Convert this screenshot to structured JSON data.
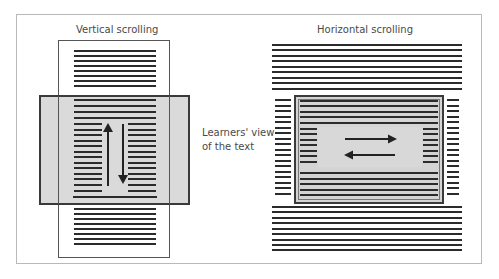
{
  "diagram": {
    "left_panel": {
      "title": "Vertical scrolling",
      "arrows": [
        "up",
        "down"
      ]
    },
    "right_panel": {
      "title": "Horizontal scrolling",
      "arrows": [
        "right",
        "left"
      ]
    },
    "center_label_line1": "Learners' view",
    "center_label_line2": "of the text"
  },
  "colors": {
    "frame": "#b9b9b9",
    "viewport_fill": "#d4d4d4",
    "viewport_border": "#3a3a3a",
    "text_line": "#2b2b2b",
    "page_border": "#555555",
    "label": "#4a4a4a"
  }
}
